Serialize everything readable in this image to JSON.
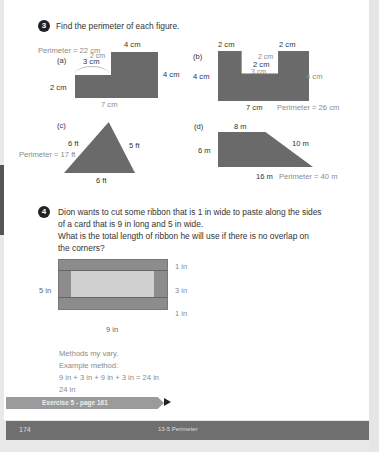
{
  "question3": {
    "number": "3",
    "prompt": "Find the perimeter of each figure.",
    "figures": {
      "a": {
        "label": "(a)",
        "answer": "Perimeter = 22 cm",
        "dims": {
          "top": "4 cm",
          "right": "4 cm",
          "left": "2 cm",
          "bottom": "7 cm",
          "notch_width": "3 cm",
          "notch_height": "2 cm"
        }
      },
      "b": {
        "label": "(b)",
        "answer": "Perimeter = 26 cm",
        "dims": {
          "top_left": "2 cm",
          "top_right": "2 cm",
          "left": "4 cm",
          "right": "4 cm",
          "bottom": "7 cm",
          "notch_depth_answer": "2 cm",
          "notch_depth": "2 cm",
          "notch_width": "3 cm"
        }
      },
      "c": {
        "label": "(c)",
        "answer": "Perimeter = 17 ft",
        "dims": {
          "left": "6 ft",
          "right": "5 ft",
          "bottom": "6 ft"
        }
      },
      "d": {
        "label": "(d)",
        "answer": "Perimeter = 40 m",
        "dims": {
          "top": "8 m",
          "left": "6 m",
          "slant": "10 m",
          "bottom": "16 m"
        }
      }
    }
  },
  "question4": {
    "number": "4",
    "lines": [
      "Dion wants to cut some ribbon that is 1 in wide to paste along the sides",
      "of a card that is 9 in long and 5 in wide.",
      "What is the total length of ribbon he will use if there is no overlap on",
      "the corners?"
    ],
    "diagram": {
      "height": "5 in",
      "width": "9 in",
      "top_band": "1 in",
      "middle": "3 in",
      "bottom_band": "1 in"
    },
    "answer_lines": [
      "Methods my vary.",
      "Example method:",
      "9 in + 3 in + 9 in + 3 in = 24 in",
      "24 in"
    ]
  },
  "exercise_link": "Exercise 5 - page 161",
  "footer": {
    "page_number": "174",
    "chapter": "13-5 Perimeter"
  }
}
